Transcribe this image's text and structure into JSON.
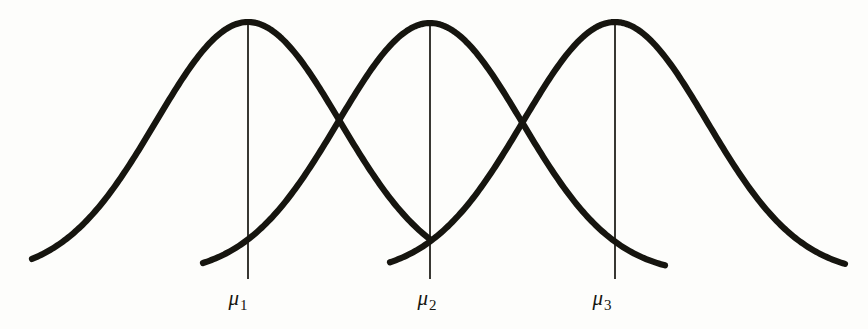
{
  "figure": {
    "kind": "three-overlapping-normal-curves",
    "background_color": "#fdfdfb",
    "ink_color": "#16150f",
    "curve_stroke_width": 6.2,
    "mean_line_stroke_width": 1.7,
    "width": 868,
    "height": 329,
    "baseline_y": 275,
    "peak_y": 22
  },
  "labels": [
    {
      "name": "mu-1",
      "glyph": "μ",
      "subscript": "1",
      "x": 238,
      "y": 288
    },
    {
      "name": "mu-2",
      "glyph": "μ",
      "subscript": "2",
      "x": 427,
      "y": 288
    },
    {
      "name": "mu-3",
      "glyph": "μ",
      "subscript": "3",
      "x": 602,
      "y": 288
    }
  ],
  "chart_data": {
    "type": "line",
    "title": "",
    "subtitle": "",
    "xlabel": "",
    "ylabel": "",
    "grid": false,
    "legend": "none",
    "axis_visible": false,
    "xlim": [
      0,
      868
    ],
    "ylim": [
      0,
      329
    ],
    "annotations": [
      "μ₁",
      "μ₂",
      "μ₃"
    ],
    "series": [
      {
        "name": "normal-curve-1",
        "distribution": "normal",
        "mean_px": 248,
        "sigma_px": 92,
        "peak_px": {
          "x": 248,
          "y": 22
        },
        "tail_start_px": {
          "x": 32,
          "y": 275
        },
        "tail_end_px": {
          "x": 430,
          "y": 277
        },
        "mean_line": {
          "x": 248,
          "y_top": 22,
          "y_bottom": 279
        }
      },
      {
        "name": "normal-curve-2",
        "distribution": "normal",
        "mean_px": 430,
        "sigma_px": 92,
        "peak_px": {
          "x": 430,
          "y": 23
        },
        "tail_start_px": {
          "x": 203,
          "y": 273
        },
        "tail_end_px": {
          "x": 665,
          "y": 272
        },
        "mean_line": {
          "x": 430,
          "y_top": 23,
          "y_bottom": 279
        }
      },
      {
        "name": "normal-curve-3",
        "distribution": "normal",
        "mean_px": 615,
        "sigma_px": 92,
        "peak_px": {
          "x": 615,
          "y": 22
        },
        "tail_start_px": {
          "x": 390,
          "y": 277
        },
        "tail_end_px": {
          "x": 845,
          "y": 275
        },
        "mean_line": {
          "x": 615,
          "y_top": 22,
          "y_bottom": 279
        }
      }
    ],
    "intersections_px": [
      {
        "x": 340,
        "y": 143,
        "between": [
          "normal-curve-1",
          "normal-curve-2"
        ]
      },
      {
        "x": 523,
        "y": 143,
        "between": [
          "normal-curve-2",
          "normal-curve-3"
        ]
      },
      {
        "x": 428,
        "y": 269,
        "between": [
          "normal-curve-1",
          "normal-curve-3"
        ]
      }
    ]
  }
}
